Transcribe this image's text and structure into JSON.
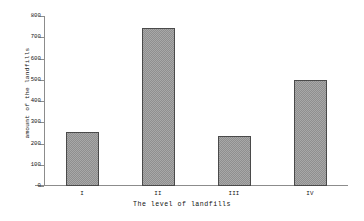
{
  "chart_data": {
    "type": "bar",
    "title": "",
    "xlabel": "The level of landfills",
    "ylabel": "amount of the landfills",
    "categories": [
      "I",
      "II",
      "III",
      "IV"
    ],
    "values": [
      253,
      745,
      237,
      497
    ],
    "ylim": [
      0,
      800
    ],
    "yticks": [
      0,
      100,
      200,
      300,
      400,
      500,
      600,
      700,
      800
    ],
    "ytick_labels": [
      "0",
      "100",
      "200",
      "300",
      "400",
      "500",
      "600",
      "700",
      "800"
    ],
    "grid": false,
    "legend": false,
    "series": [
      {
        "name": "amount of the landfills",
        "values": [
          253,
          745,
          237,
          497
        ]
      }
    ],
    "bar_fill_color": "#a8a8a8",
    "bar_edge_color": "#4a4a4a",
    "axis_color": "#8c8c8c",
    "background_color": "#ffffff"
  }
}
